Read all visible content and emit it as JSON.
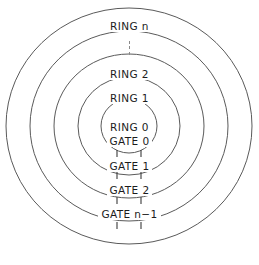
{
  "diagram": {
    "background_color": "#ffffff",
    "stroke_color": "#5a5a5a",
    "text_color": "#1c1c1c",
    "width": 259,
    "height": 265,
    "center": {
      "x": 129,
      "y": 126
    }
  },
  "rings": [
    {
      "id": "ring-n",
      "label": "RING n",
      "rx": 123,
      "ry": 118,
      "label_y": 21
    },
    {
      "id": "ring-2",
      "label": "RING 2",
      "rx": 99,
      "ry": 95,
      "label_y": 69
    },
    {
      "id": "ring-1",
      "label": "RING 1",
      "rx": 75,
      "ry": 72,
      "label_y": 93
    },
    {
      "id": "ring-0",
      "label": "RING 0",
      "rx": 28,
      "ry": 27,
      "label_y": 122
    }
  ],
  "ring_hidden_marker": {
    "label": "vertical-ellipsis",
    "dot_count": 3,
    "top": 38,
    "color": "#8a8a8a"
  },
  "gates": [
    {
      "id": "gate-0",
      "label": "GATE 0",
      "label_y": 136,
      "tick_y": 150,
      "tick_height": 7,
      "tick_offset": 12
    },
    {
      "id": "gate-1",
      "label": "GATE 1",
      "label_y": 161,
      "tick_y": 172,
      "tick_height": 7,
      "tick_offset": 12
    },
    {
      "id": "gate-2",
      "label": "GATE 2",
      "label_y": 185,
      "tick_y": 197,
      "tick_height": 7,
      "tick_offset": 12
    },
    {
      "id": "gate-n-1",
      "label": "GATE n−1",
      "label_y": 209,
      "tick_y": 222,
      "tick_height": 7,
      "tick_offset": 12
    }
  ],
  "extra_ticks": [
    {
      "id": "tick-above-gate-n-1",
      "tick_y": 198,
      "tick_height": 7,
      "tick_offset": 12
    }
  ]
}
